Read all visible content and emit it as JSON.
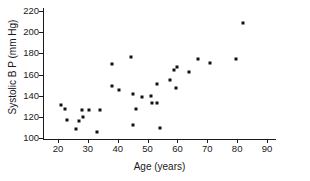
{
  "chart_data": {
    "type": "scatter",
    "title": "",
    "xlabel": "Age (years)",
    "ylabel": "Systolic B P (mm Hg)",
    "xlim": [
      15,
      93
    ],
    "ylim": [
      98,
      223
    ],
    "xticks": [
      20,
      30,
      40,
      50,
      60,
      70,
      80,
      90
    ],
    "yticks": [
      100,
      120,
      140,
      160,
      180,
      200,
      220
    ],
    "grid": false,
    "legend": null,
    "marker_color": "#111111",
    "axis_color": "#1a1a1a",
    "background_color": "#ffffff",
    "points": [
      {
        "x": 21,
        "y": 131
      },
      {
        "x": 22.5,
        "y": 127
      },
      {
        "x": 23,
        "y": 117
      },
      {
        "x": 26,
        "y": 108
      },
      {
        "x": 27,
        "y": 116
      },
      {
        "x": 28,
        "y": 126
      },
      {
        "x": 28.5,
        "y": 120
      },
      {
        "x": 30.5,
        "y": 126
      },
      {
        "x": 33,
        "y": 106
      },
      {
        "x": 34,
        "y": 126
      },
      {
        "x": 38,
        "y": 170
      },
      {
        "x": 38,
        "y": 149
      },
      {
        "x": 40.5,
        "y": 145
      },
      {
        "x": 44.5,
        "y": 177
      },
      {
        "x": 45,
        "y": 142
      },
      {
        "x": 45,
        "y": 112
      },
      {
        "x": 46,
        "y": 127
      },
      {
        "x": 48,
        "y": 139
      },
      {
        "x": 51,
        "y": 140
      },
      {
        "x": 51.5,
        "y": 133
      },
      {
        "x": 53,
        "y": 151
      },
      {
        "x": 53,
        "y": 133
      },
      {
        "x": 54,
        "y": 109
      },
      {
        "x": 57.5,
        "y": 155
      },
      {
        "x": 59,
        "y": 164
      },
      {
        "x": 59.5,
        "y": 147
      },
      {
        "x": 60,
        "y": 167
      },
      {
        "x": 64,
        "y": 162
      },
      {
        "x": 67,
        "y": 175
      },
      {
        "x": 71,
        "y": 171
      },
      {
        "x": 79.5,
        "y": 175
      },
      {
        "x": 82,
        "y": 209
      }
    ]
  }
}
